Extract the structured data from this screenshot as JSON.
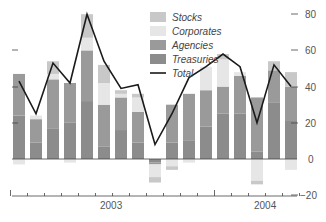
{
  "chart_data": {
    "type": "bar",
    "subtype": "stacked-bar-with-line",
    "title": "",
    "xlabel": "",
    "ylabel": "",
    "ylim": [
      -20,
      85
    ],
    "yticks": [
      -20,
      0,
      20,
      40,
      60,
      80
    ],
    "ytick_labels": [
      "−20",
      "0",
      "20",
      "40",
      "60",
      "80"
    ],
    "y_axis_position": "right",
    "grid": false,
    "x_year_labels": [
      {
        "label": "2003",
        "bar_index": 6.5
      },
      {
        "label": "2004",
        "bar_index": 15
      }
    ],
    "x_year_separators": [
      0,
      12
    ],
    "categories": [
      "1",
      "2",
      "3",
      "4",
      "5",
      "6",
      "7",
      "8",
      "9",
      "10",
      "11",
      "12",
      "13",
      "14",
      "15",
      "16",
      "17"
    ],
    "series": [
      {
        "name": "Treasuries",
        "color": "#8c8c8c",
        "values": [
          24,
          9,
          17,
          20,
          32,
          7,
          16,
          9,
          -2,
          9,
          10,
          18,
          25,
          25,
          4,
          31,
          21
        ]
      },
      {
        "name": "Agencies",
        "color": "#9a9a9a",
        "values": [
          23,
          13,
          27,
          22,
          28,
          23,
          18,
          17,
          -1,
          21,
          26,
          20,
          15,
          21,
          30,
          18,
          19
        ]
      },
      {
        "name": "Corporates",
        "color": "#e6e6e6",
        "values": [
          -3,
          2,
          3,
          -2,
          7,
          12,
          2,
          8,
          -7,
          -4,
          -2,
          13,
          15,
          2,
          -12,
          0,
          -6
        ]
      },
      {
        "name": "Stocks",
        "color": "#c8c8c8",
        "values": [
          0,
          0,
          7,
          0,
          13,
          10,
          2,
          2,
          -3,
          -2,
          0,
          0,
          3,
          0,
          -2,
          5,
          8
        ]
      }
    ],
    "negative_extent": [
      -4,
      -1,
      0,
      -2,
      0,
      -1,
      -5,
      0,
      -12,
      -7,
      -4,
      0,
      0,
      -1,
      -15,
      0,
      -7
    ],
    "line": {
      "name": "Total",
      "color": "#1a1a1a",
      "values": [
        43,
        25,
        53,
        42,
        80,
        54,
        39,
        41,
        8,
        25,
        45,
        51,
        58,
        51,
        20,
        52,
        40
      ]
    },
    "legend": {
      "position": "top-right-inside",
      "entries": [
        "Stocks",
        "Corporates",
        "Agencies",
        "Treasuries",
        "Total"
      ]
    }
  },
  "legend": {
    "stocks": "Stocks",
    "corporates": "Corporates",
    "agencies": "Agencies",
    "treasuries": "Treasuries",
    "total": "Total"
  },
  "axis": {
    "y80": "80",
    "y60": "60",
    "y40": "40",
    "y20": "20",
    "y0": "0",
    "yneg20": "−20",
    "year1": "2003",
    "year2": "2004"
  }
}
